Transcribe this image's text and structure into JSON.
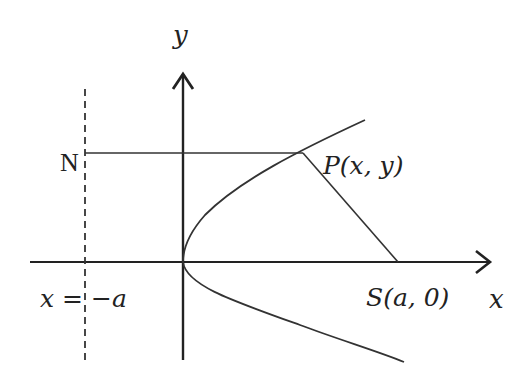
{
  "diagram": {
    "labels": {
      "y_axis": "y",
      "x_axis": "x",
      "point_N": "N",
      "point_P": "P(x, y)",
      "focus": "S(a, 0)",
      "directrix": "x = −a"
    },
    "colors": {
      "stroke": "#222222",
      "background": "#ffffff"
    },
    "elements": [
      "y-axis with arrow",
      "x-axis with arrow",
      "dashed directrix x = -a",
      "parabola y^2 = 4ax opening right",
      "segment NP (horizontal)",
      "segment PS"
    ]
  }
}
